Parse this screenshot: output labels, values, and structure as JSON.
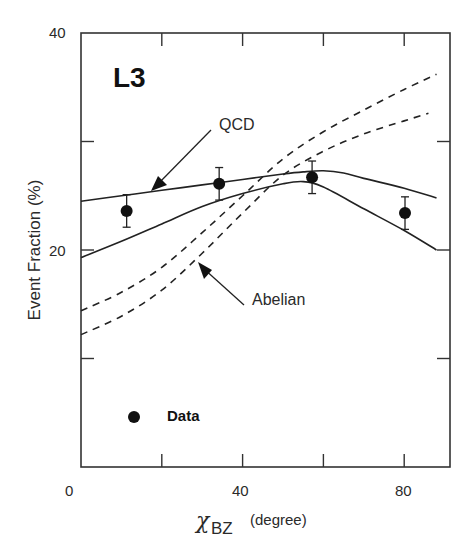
{
  "chart_data": {
    "type": "line",
    "brand_label": "L3",
    "title": "",
    "xlabel": "χ_BZ (degree)",
    "xlabel_symbol": "χ",
    "xlabel_subscript": "BZ",
    "xlabel_unit": "(degree)",
    "ylabel": "Event Fraction (%)",
    "xlim": [
      0,
      91
    ],
    "ylim": [
      0,
      40
    ],
    "x_ticks": [
      0,
      20,
      40,
      60,
      80
    ],
    "x_tick_labels": [
      "0",
      "40",
      "80"
    ],
    "x_tick_labeled_values": [
      0,
      40,
      80
    ],
    "y_ticks": [
      0,
      10,
      20,
      30,
      40
    ],
    "y_tick_labels": [
      "20",
      "40"
    ],
    "y_tick_labeled_values": [
      20,
      40
    ],
    "grid": false,
    "legend": {
      "position": "lower-left",
      "entries": [
        {
          "label": "Data",
          "marker": "filled-circle"
        }
      ]
    },
    "annotations": [
      {
        "text": "QCD",
        "arrow_to": [
          20,
          25.5
        ]
      },
      {
        "text": "Abelian",
        "arrow_to": [
          32,
          18.5
        ]
      }
    ],
    "series": [
      {
        "name": "Data",
        "kind": "points",
        "x": [
          11.3,
          34.2,
          57.2,
          80.2
        ],
        "y": [
          23.6,
          26.1,
          26.7,
          23.4
        ],
        "yerr": [
          1.5,
          1.5,
          1.5,
          1.5
        ]
      },
      {
        "name": "QCD",
        "kind": "solid",
        "x": [
          0,
          10,
          20,
          30,
          40,
          50,
          55,
          60,
          65,
          70,
          80,
          88
        ],
        "y": [
          24.5,
          25.0,
          25.5,
          26.0,
          26.5,
          27.0,
          27.2,
          27.3,
          27.1,
          26.6,
          25.7,
          24.8
        ]
      },
      {
        "name": "QCD (lower band)",
        "kind": "solid",
        "x": [
          0,
          10,
          20,
          30,
          40,
          50,
          55,
          60,
          70,
          80,
          88
        ],
        "y": [
          19.3,
          20.8,
          22.4,
          24.0,
          25.2,
          26.1,
          26.3,
          25.8,
          23.8,
          21.8,
          20.0
        ]
      },
      {
        "name": "Abelian",
        "kind": "dashed",
        "x": [
          0,
          10,
          20,
          30,
          40,
          50,
          60,
          70,
          80,
          88
        ],
        "y": [
          14.4,
          16.1,
          18.4,
          21.6,
          25.0,
          28.4,
          30.9,
          32.9,
          34.8,
          36.2
        ]
      },
      {
        "name": "Abelian (lower band)",
        "kind": "dashed",
        "x": [
          0,
          10,
          20,
          30,
          40,
          50,
          60,
          70,
          80,
          86
        ],
        "y": [
          12.2,
          13.9,
          16.3,
          19.7,
          23.4,
          26.9,
          29.1,
          30.7,
          31.9,
          32.6
        ]
      }
    ]
  },
  "plot": {
    "brand": "L3",
    "ylabel": "Event Fraction (%)",
    "x_tick_text": {
      "t0": "0",
      "t40": "40",
      "t80": "80"
    },
    "y_tick_text": {
      "t20": "20",
      "t40": "40"
    },
    "xlabel_symbol": "χ",
    "xlabel_sub": "BZ",
    "xlabel_unit": "(degree)",
    "annotation_qcd": "QCD",
    "annotation_abelian": "Abelian",
    "legend_label": "Data",
    "colors": {
      "ink": "#1a1a1a",
      "axis": "#333333",
      "background": "#ffffff"
    }
  }
}
